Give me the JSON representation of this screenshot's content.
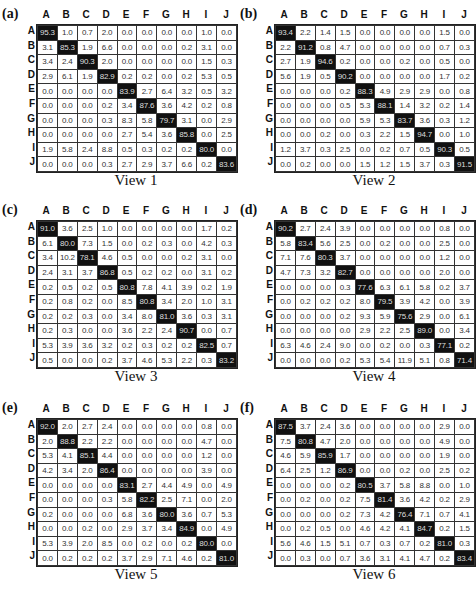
{
  "chart_data": [
    {
      "type": "heatmap",
      "panel_label": "(a)",
      "title": "View 1",
      "row_labels": [
        "A",
        "B",
        "C",
        "D",
        "E",
        "F",
        "G",
        "H",
        "I",
        "J"
      ],
      "col_labels": [
        "A",
        "B",
        "C",
        "D",
        "E",
        "F",
        "G",
        "H",
        "I",
        "J"
      ],
      "values": [
        [
          "95.3",
          "1.0",
          "0.7",
          "2.0",
          "0.0",
          "0.0",
          "0.0",
          "0.0",
          "1.0",
          "0.0"
        ],
        [
          "3.1",
          "85.3",
          "1.9",
          "6.6",
          "0.0",
          "0.0",
          "0.0",
          "0.2",
          "3.1",
          "0.0"
        ],
        [
          "3.4",
          "2.4",
          "90.3",
          "2.0",
          "0.0",
          "0.0",
          "0.0",
          "0.0",
          "1.5",
          "0.3"
        ],
        [
          "2.9",
          "6.1",
          "1.9",
          "82.9",
          "0.2",
          "0.2",
          "0.0",
          "0.2",
          "5.3",
          "0.5"
        ],
        [
          "0.0",
          "0.0",
          "0.0",
          "0.0",
          "83.9",
          "2.7",
          "6.4",
          "3.2",
          "0.5",
          "3.2"
        ],
        [
          "0.0",
          "0.0",
          "0.0",
          "0.2",
          "3.4",
          "87.6",
          "3.6",
          "4.2",
          "0.2",
          "0.8"
        ],
        [
          "0.0",
          "0.0",
          "0.0",
          "0.3",
          "8.3",
          "5.8",
          "79.7",
          "3.1",
          "0.0",
          "2.9"
        ],
        [
          "0.0",
          "0.0",
          "0.0",
          "0.0",
          "2.7",
          "5.4",
          "3.6",
          "85.8",
          "0.0",
          "2.5"
        ],
        [
          "1.9",
          "5.8",
          "2.4",
          "8.8",
          "0.5",
          "0.3",
          "0.2",
          "0.2",
          "80.0",
          "0.0"
        ],
        [
          "0.0",
          "0.0",
          "0.0",
          "0.3",
          "2.7",
          "2.9",
          "3.7",
          "6.6",
          "0.2",
          "83.6"
        ]
      ]
    },
    {
      "type": "heatmap",
      "panel_label": "(b)",
      "title": "View 2",
      "row_labels": [
        "A",
        "B",
        "C",
        "D",
        "E",
        "F",
        "G",
        "H",
        "I",
        "J"
      ],
      "col_labels": [
        "A",
        "B",
        "C",
        "D",
        "E",
        "F",
        "G",
        "H",
        "I",
        "J"
      ],
      "values": [
        [
          "93.4",
          "2.2",
          "1.4",
          "1.5",
          "0.0",
          "0.0",
          "0.0",
          "0.0",
          "1.5",
          "0.0"
        ],
        [
          "2.2",
          "91.2",
          "0.8",
          "4.7",
          "0.0",
          "0.0",
          "0.0",
          "0.0",
          "0.7",
          "0.3"
        ],
        [
          "2.7",
          "1.9",
          "94.6",
          "0.2",
          "0.0",
          "0.0",
          "0.2",
          "0.0",
          "0.5",
          "0.0"
        ],
        [
          "5.6",
          "1.9",
          "0.5",
          "90.2",
          "0.0",
          "0.0",
          "0.0",
          "0.0",
          "1.7",
          "0.2"
        ],
        [
          "0.0",
          "0.0",
          "0.0",
          "0.2",
          "88.3",
          "4.9",
          "2.9",
          "2.9",
          "0.0",
          "0.8"
        ],
        [
          "0.0",
          "0.0",
          "0.0",
          "0.5",
          "5.3",
          "88.1",
          "1.4",
          "3.2",
          "0.2",
          "1.4"
        ],
        [
          "0.0",
          "0.0",
          "0.0",
          "0.0",
          "5.9",
          "5.3",
          "83.7",
          "3.6",
          "0.3",
          "1.2"
        ],
        [
          "0.0",
          "0.0",
          "0.2",
          "0.0",
          "0.3",
          "2.2",
          "1.5",
          "94.7",
          "0.0",
          "1.0"
        ],
        [
          "1.2",
          "3.7",
          "0.3",
          "2.5",
          "0.0",
          "0.2",
          "0.7",
          "0.5",
          "90.3",
          "0.5"
        ],
        [
          "0.0",
          "0.2",
          "0.0",
          "0.0",
          "1.5",
          "1.2",
          "1.5",
          "3.7",
          "0.3",
          "91.5"
        ]
      ]
    },
    {
      "type": "heatmap",
      "panel_label": "(c)",
      "title": "View 3",
      "row_labels": [
        "A",
        "B",
        "C",
        "D",
        "E",
        "F",
        "G",
        "H",
        "I",
        "J"
      ],
      "col_labels": [
        "A",
        "B",
        "C",
        "D",
        "E",
        "F",
        "G",
        "H",
        "I",
        "J"
      ],
      "values": [
        [
          "91.0",
          "3.6",
          "2.5",
          "1.0",
          "0.0",
          "0.0",
          "0.0",
          "0.0",
          "1.7",
          "0.2"
        ],
        [
          "6.1",
          "80.0",
          "7.3",
          "1.5",
          "0.0",
          "0.2",
          "0.3",
          "0.0",
          "4.2",
          "0.3"
        ],
        [
          "3.4",
          "10.2",
          "78.1",
          "4.6",
          "0.5",
          "0.0",
          "0.0",
          "0.2",
          "3.1",
          "0.0"
        ],
        [
          "2.4",
          "3.1",
          "3.7",
          "86.8",
          "0.5",
          "0.2",
          "0.2",
          "0.0",
          "3.1",
          "0.2"
        ],
        [
          "0.2",
          "0.5",
          "0.2",
          "0.5",
          "80.8",
          "7.8",
          "4.1",
          "3.9",
          "0.2",
          "1.9"
        ],
        [
          "0.2",
          "0.8",
          "0.2",
          "0.0",
          "8.5",
          "80.8",
          "3.4",
          "2.0",
          "1.0",
          "3.1"
        ],
        [
          "0.2",
          "0.2",
          "0.3",
          "0.0",
          "3.4",
          "8.0",
          "81.0",
          "3.6",
          "0.3",
          "3.1"
        ],
        [
          "0.2",
          "0.3",
          "0.0",
          "0.0",
          "3.6",
          "2.2",
          "2.4",
          "90.7",
          "0.0",
          "0.7"
        ],
        [
          "5.3",
          "3.9",
          "3.6",
          "3.2",
          "0.2",
          "0.3",
          "0.2",
          "0.2",
          "82.5",
          "0.7"
        ],
        [
          "0.5",
          "0.0",
          "0.0",
          "0.2",
          "3.7",
          "4.6",
          "5.3",
          "2.2",
          "0.3",
          "83.2"
        ]
      ]
    },
    {
      "type": "heatmap",
      "panel_label": "(d)",
      "title": "View 4",
      "row_labels": [
        "A",
        "B",
        "C",
        "D",
        "E",
        "F",
        "G",
        "H",
        "I",
        "J"
      ],
      "col_labels": [
        "A",
        "B",
        "C",
        "D",
        "E",
        "F",
        "G",
        "H",
        "I",
        "J"
      ],
      "values": [
        [
          "90.2",
          "2.7",
          "2.4",
          "3.9",
          "0.0",
          "0.0",
          "0.0",
          "0.0",
          "0.8",
          "0.0"
        ],
        [
          "5.8",
          "83.4",
          "5.6",
          "2.5",
          "0.0",
          "0.2",
          "0.0",
          "0.0",
          "2.5",
          "0.0"
        ],
        [
          "7.1",
          "7.6",
          "80.3",
          "3.7",
          "0.0",
          "0.0",
          "0.0",
          "0.0",
          "1.2",
          "0.0"
        ],
        [
          "4.7",
          "7.3",
          "3.2",
          "82.7",
          "0.0",
          "0.0",
          "0.0",
          "0.0",
          "2.0",
          "0.0"
        ],
        [
          "0.0",
          "0.0",
          "0.0",
          "0.3",
          "77.6",
          "6.3",
          "6.1",
          "5.8",
          "0.2",
          "3.7"
        ],
        [
          "0.0",
          "0.2",
          "0.2",
          "0.2",
          "8.0",
          "79.5",
          "3.9",
          "4.2",
          "0.0",
          "3.9"
        ],
        [
          "0.0",
          "0.0",
          "0.0",
          "0.2",
          "9.3",
          "5.9",
          "75.6",
          "2.9",
          "0.0",
          "6.1"
        ],
        [
          "0.0",
          "0.0",
          "0.0",
          "0.0",
          "2.9",
          "2.2",
          "2.5",
          "89.0",
          "0.0",
          "3.4"
        ],
        [
          "6.3",
          "4.6",
          "2.4",
          "9.0",
          "0.0",
          "0.2",
          "0.0",
          "0.3",
          "77.1",
          "0.2"
        ],
        [
          "0.0",
          "0.0",
          "0.0",
          "0.2",
          "5.3",
          "5.4",
          "11.9",
          "5.1",
          "0.8",
          "71.4"
        ]
      ]
    },
    {
      "type": "heatmap",
      "panel_label": "(e)",
      "title": "View 5",
      "row_labels": [
        "A",
        "B",
        "C",
        "D",
        "E",
        "F",
        "G",
        "H",
        "I",
        "J"
      ],
      "col_labels": [
        "A",
        "B",
        "C",
        "D",
        "E",
        "F",
        "G",
        "H",
        "I",
        "J"
      ],
      "values": [
        [
          "92.0",
          "2.0",
          "2.7",
          "2.4",
          "0.0",
          "0.0",
          "0.0",
          "0.0",
          "0.8",
          "0.0"
        ],
        [
          "2.0",
          "88.8",
          "2.2",
          "2.2",
          "0.0",
          "0.0",
          "0.0",
          "0.0",
          "4.7",
          "0.0"
        ],
        [
          "5.3",
          "4.1",
          "85.1",
          "4.4",
          "0.0",
          "0.0",
          "0.0",
          "0.0",
          "1.2",
          "0.0"
        ],
        [
          "4.2",
          "3.4",
          "2.0",
          "86.4",
          "0.0",
          "0.0",
          "0.0",
          "0.0",
          "3.9",
          "0.0"
        ],
        [
          "0.0",
          "0.0",
          "0.0",
          "0.0",
          "83.1",
          "2.7",
          "4.4",
          "4.9",
          "0.0",
          "4.9"
        ],
        [
          "0.0",
          "0.0",
          "0.0",
          "0.3",
          "5.8",
          "82.2",
          "2.5",
          "7.1",
          "0.0",
          "2.0"
        ],
        [
          "0.2",
          "0.0",
          "0.0",
          "0.0",
          "6.8",
          "3.6",
          "80.0",
          "3.6",
          "0.7",
          "5.3"
        ],
        [
          "0.0",
          "0.0",
          "0.2",
          "0.0",
          "2.9",
          "3.7",
          "3.4",
          "84.9",
          "0.0",
          "4.9"
        ],
        [
          "5.3",
          "3.9",
          "2.0",
          "8.5",
          "0.0",
          "0.2",
          "0.0",
          "0.2",
          "80.0",
          "0.0"
        ],
        [
          "0.0",
          "0.2",
          "0.2",
          "0.2",
          "3.7",
          "2.9",
          "7.1",
          "4.6",
          "0.2",
          "81.0"
        ]
      ]
    },
    {
      "type": "heatmap",
      "panel_label": "(f)",
      "title": "View 6",
      "row_labels": [
        "A",
        "B",
        "C",
        "D",
        "E",
        "F",
        "G",
        "H",
        "I",
        "J"
      ],
      "col_labels": [
        "A",
        "B",
        "C",
        "D",
        "E",
        "F",
        "G",
        "H",
        "I",
        "J"
      ],
      "values": [
        [
          "87.5",
          "3.7",
          "2.4",
          "3.6",
          "0.0",
          "0.0",
          "0.0",
          "0.0",
          "2.9",
          "0.0"
        ],
        [
          "7.5",
          "80.8",
          "4.7",
          "2.0",
          "0.0",
          "0.0",
          "0.0",
          "0.0",
          "4.9",
          "0.0"
        ],
        [
          "4.6",
          "5.9",
          "85.9",
          "1.7",
          "0.0",
          "0.0",
          "0.0",
          "0.0",
          "1.9",
          "0.0"
        ],
        [
          "6.4",
          "2.5",
          "1.2",
          "86.9",
          "0.0",
          "0.0",
          "0.2",
          "0.0",
          "2.5",
          "0.2"
        ],
        [
          "0.0",
          "0.0",
          "0.0",
          "0.2",
          "80.5",
          "3.7",
          "5.8",
          "8.8",
          "0.0",
          "1.0"
        ],
        [
          "0.0",
          "0.2",
          "0.0",
          "0.2",
          "7.5",
          "81.4",
          "3.6",
          "4.2",
          "0.2",
          "2.9"
        ],
        [
          "0.0",
          "0.0",
          "0.0",
          "0.2",
          "7.3",
          "4.2",
          "76.4",
          "7.1",
          "0.7",
          "4.1"
        ],
        [
          "0.0",
          "0.2",
          "0.5",
          "0.0",
          "4.6",
          "4.2",
          "4.1",
          "84.7",
          "0.2",
          "1.5"
        ],
        [
          "5.6",
          "4.6",
          "1.5",
          "5.1",
          "0.7",
          "0.3",
          "0.7",
          "0.2",
          "81.0",
          "0.3"
        ],
        [
          "0.0",
          "0.3",
          "0.0",
          "0.7",
          "3.6",
          "3.1",
          "4.1",
          "4.7",
          "0.2",
          "83.4"
        ]
      ]
    }
  ]
}
